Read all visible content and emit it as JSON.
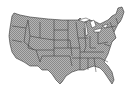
{
  "map": {
    "title": "United States",
    "style": "hatched",
    "colors": {
      "fill": "#a8a8a8",
      "hatch": "#808080",
      "border": "#333333",
      "background": "#ffffff"
    }
  }
}
